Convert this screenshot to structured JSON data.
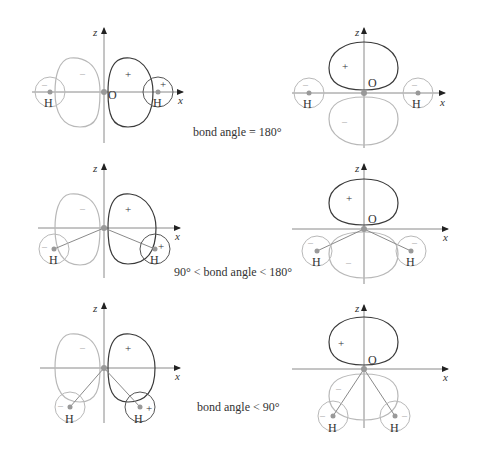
{
  "figure": {
    "colors": {
      "positive_lobe": "#3a3a3a",
      "negative_lobe": "#b8b8b8",
      "axis": "#8a8a8a",
      "bond": "#8a8a8a",
      "atom_dot": "#999999",
      "text": "#333333"
    },
    "labels": {
      "z_axis": "z",
      "x_axis": "x",
      "oxygen": "O",
      "hydrogen": "H",
      "plus": "+",
      "minus": "–"
    },
    "rows": [
      {
        "caption": "bond angle = 180°"
      },
      {
        "caption": "90° < bond angle < 180°"
      },
      {
        "caption": "bond angle < 90°"
      }
    ]
  }
}
